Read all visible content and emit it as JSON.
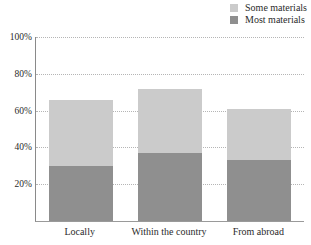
{
  "chart_data": {
    "type": "bar",
    "stacked": true,
    "title": "",
    "xlabel": "",
    "ylabel": "",
    "categories": [
      "Locally",
      "Within the country",
      "From abroad"
    ],
    "series": [
      {
        "name": "Some materials",
        "values": [
          36,
          35,
          28
        ],
        "color": "#cbcbcb"
      },
      {
        "name": "Most materials",
        "values": [
          30,
          37,
          33
        ],
        "color": "#8f8f8f"
      }
    ],
    "stack_order_bottom_to_top": [
      "Most materials",
      "Some materials"
    ],
    "stack_totals_percent": [
      66,
      72,
      61
    ],
    "ylim": [
      0,
      100
    ],
    "y_ticks": [
      "20%",
      "40%",
      "60%",
      "80%",
      "100%"
    ],
    "y_tick_values": [
      20,
      40,
      60,
      80,
      100
    ],
    "grid": "horizontal-dotted",
    "legend_position": "top-right",
    "axis_color": "#9a9a9a",
    "gridline_color": "#b5b5b5"
  }
}
